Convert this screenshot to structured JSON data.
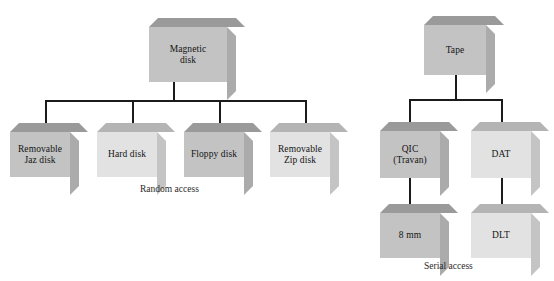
{
  "diagram": {
    "colors": {
      "box_dark_face": "#c3c3c3",
      "box_light_face": "#e2e2e2",
      "box_dark_top": "#9a9a9a",
      "box_light_top": "#b4b4b4",
      "box_dark_side": "#ababab",
      "box_light_side": "#c4c4c4",
      "connector": "#1b1b1b",
      "background": "#ffffff",
      "text": "#141414"
    },
    "groups": [
      {
        "name": "random-access-group",
        "caption": "Random access",
        "root": {
          "id": "magnetic-disk",
          "label": "Magnetic\ndisk",
          "shade": "dark"
        },
        "children": [
          {
            "id": "removable-jaz-disk",
            "label": "Removable\nJaz disk",
            "shade": "dark"
          },
          {
            "id": "hard-disk",
            "label": "Hard disk",
            "shade": "light"
          },
          {
            "id": "floppy-disk",
            "label": "Floppy disk",
            "shade": "dark"
          },
          {
            "id": "removable-zip-disk",
            "label": "Removable\nZip disk",
            "shade": "light"
          }
        ]
      },
      {
        "name": "serial-access-group",
        "caption": "Serial access",
        "root": {
          "id": "tape",
          "label": "Tape",
          "shade": "dark"
        },
        "children": [
          {
            "id": "qic-travan",
            "label": "QIC\n(Travan)",
            "shade": "dark",
            "child": {
              "id": "eight-mm",
              "label": "8 mm",
              "shade": "dark"
            }
          },
          {
            "id": "dat",
            "label": "DAT",
            "shade": "light",
            "child": {
              "id": "dlt",
              "label": "DLT",
              "shade": "light"
            }
          }
        ]
      }
    ]
  }
}
